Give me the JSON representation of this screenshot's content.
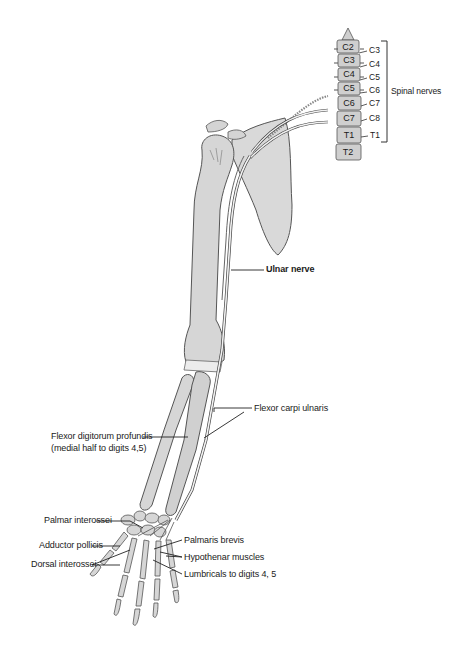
{
  "figure": {
    "colors": {
      "bone_fill": "#d6d6d6",
      "bone_stroke": "#555555",
      "nerve_fill": "#f2f2f2",
      "nerve_stroke": "#444444",
      "leader_line": "#222222",
      "vertebra_fill": "#cfcfcf"
    }
  },
  "spine": {
    "vertebrae": [
      "C2",
      "C3",
      "C4",
      "C5",
      "C6",
      "C7",
      "T1",
      "T2"
    ],
    "nerve_roots": [
      "C3",
      "C4",
      "C5",
      "C6",
      "C7",
      "C8",
      "T1"
    ],
    "bracket_label": "Spinal nerves"
  },
  "labels": {
    "ulnar_nerve": "Ulnar nerve",
    "flexor_carpi_ulnaris": "Flexor carpi ulnaris",
    "flexor_digitorum_profundis_line1": "Flexor digitorum profundis",
    "flexor_digitorum_profundis_line2": "(medial half to digits 4,5)",
    "palmar_interossei": "Palmar interossei",
    "adductor_pollicis": "Adductor pollicis",
    "dorsal_interossei": "Dorsal interossei",
    "palmaris_brevis": "Palmaris brevis",
    "hypothenar_muscles": "Hypothenar muscles",
    "lumbricals": "Lumbricals to digits 4, 5"
  }
}
